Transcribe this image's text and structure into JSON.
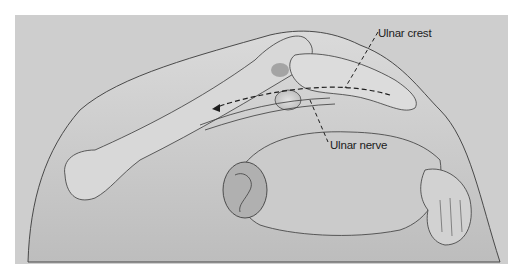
{
  "figure": {
    "background_color": "#cfcfcf",
    "border_color": "#ffffff",
    "line_color": "#2a2a2a",
    "labels": [
      {
        "id": "ulnar-crest",
        "text": "Ulnar crest",
        "x": 378,
        "y": 28
      },
      {
        "id": "ulnar-nerve",
        "text": "Ulnar nerve",
        "x": 330,
        "y": 140
      }
    ]
  }
}
